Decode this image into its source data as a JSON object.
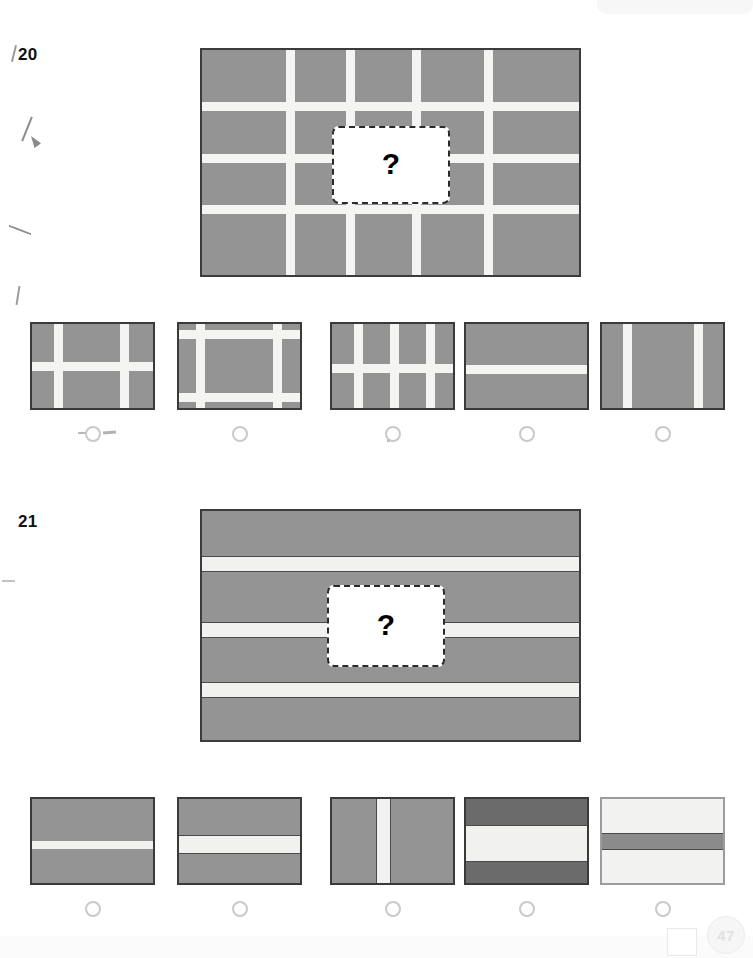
{
  "page": {
    "page_number": "47",
    "background_color": "#ffffff",
    "ink_gray": "#949494",
    "ink_gray_dark": "#6b6b6b",
    "ink_light": "#f2f2f0",
    "border_color": "#3a3a3a"
  },
  "questions": [
    {
      "number": "20",
      "missing_marker": "?",
      "stimulus": {
        "type": "grid",
        "fill": "#949494",
        "line_color": "#f4f4f2",
        "vertical_lines_pct": [
          23.5,
          39.5,
          57.0,
          76.0
        ],
        "horizontal_lines_pct": [
          25.0,
          48.0,
          71.0
        ],
        "line_thickness_px": 9
      },
      "options": [
        {
          "letter": "A",
          "pattern": "cross-two-lines",
          "vertical_lines_pct": [
            21.0,
            74.0
          ],
          "horizontal_lines_pct": [
            48.0
          ],
          "fill": "#949494"
        },
        {
          "letter": "B",
          "pattern": "frame-border-lines",
          "vertical_lines_pct": [
            17.0,
            79.0
          ],
          "horizontal_lines_pct": [
            12.0,
            83.0
          ],
          "fill": "#949494"
        },
        {
          "letter": "C",
          "pattern": "dense-grid",
          "vertical_lines_pct": [
            21.0,
            50.0,
            79.0
          ],
          "horizontal_lines_pct": [
            50.0
          ],
          "fill": "#949494"
        },
        {
          "letter": "D",
          "pattern": "single-horizontal-line",
          "vertical_lines_pct": [],
          "horizontal_lines_pct": [
            52.0
          ],
          "fill": "#949494"
        },
        {
          "letter": "E",
          "pattern": "two-vertical-lines",
          "vertical_lines_pct": [
            20.0,
            77.0
          ],
          "horizontal_lines_pct": [],
          "fill": "#949494"
        }
      ]
    },
    {
      "number": "21",
      "missing_marker": "?",
      "stimulus": {
        "type": "horizontal-stripes",
        "fill": "#949494",
        "stripe_color": "#f1f1ef",
        "stripe_edge_color": "#4a4a4a",
        "stripe_centers_pct": [
          23.0,
          52.0,
          78.0
        ],
        "stripe_thickness_px": 16
      },
      "options": [
        {
          "letter": "A",
          "pattern": "thin-white-stripe",
          "stripe_centers_pct": [
            52.0
          ],
          "stripe_thickness_px": 8,
          "fill": "#949494",
          "edges": false
        },
        {
          "letter": "B",
          "pattern": "thick-white-stripe-outlined",
          "stripe_centers_pct": [
            52.0
          ],
          "stripe_thickness_px": 19,
          "fill": "#949494",
          "edges": true
        },
        {
          "letter": "C",
          "pattern": "vertical-white-stripe",
          "stripe_center_pct": 41.0,
          "stripe_thickness_px": 15,
          "fill": "#949494",
          "orientation": "vertical"
        },
        {
          "letter": "D",
          "pattern": "dark-gray-thick-white-band",
          "stripe_centers_pct": [
            50.0
          ],
          "stripe_thickness_px": 37,
          "fill": "#6b6b6b",
          "edges": true
        },
        {
          "letter": "E",
          "pattern": "inverted-gray-stripe-on-light",
          "stripe_centers_pct": [
            48.0
          ],
          "stripe_thickness_px": 17,
          "fill": "#f2f2f0",
          "stripe_fill": "#8b8b8b",
          "edges": true
        }
      ]
    }
  ]
}
